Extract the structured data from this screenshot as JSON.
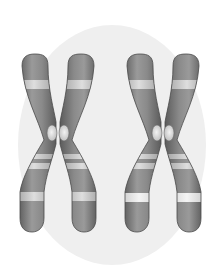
{
  "image": {
    "subject": "Two replicated chromosomes (X-shaped sister chromatid pairs) on a light gray oval background",
    "alt_text": "Illustration of two X-shaped chromosomes with banding",
    "colors": {
      "background": "#ffffff",
      "oval": "#efefef",
      "chromatid_dark": "#5e5e5e",
      "chromatid_mid": "#8a8a8a",
      "chromatid_light": "#b5b5b5",
      "band_light": "#d9d9d9",
      "band_bright": "#eeeeee",
      "centromere": "#e4e4e4",
      "outline": "#4a4a4a"
    },
    "chromosomes": [
      {
        "id": "chromosome-1",
        "center_x": 58
      },
      {
        "id": "chromosome-2",
        "center_x": 162
      }
    ]
  }
}
